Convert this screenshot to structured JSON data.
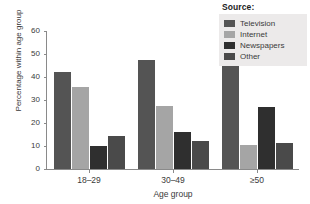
{
  "chart_data": {
    "type": "bar",
    "title": "",
    "xlabel": "Age group",
    "ylabel": "Percentage within age group",
    "categories": [
      "18–29",
      "30–49",
      "≥50"
    ],
    "series": [
      {
        "name": "Television",
        "values": [
          42,
          47.5,
          55.5
        ],
        "color": "#545454"
      },
      {
        "name": "Internet",
        "values": [
          35.5,
          27.5,
          10.5
        ],
        "color": "#a5a5a5"
      },
      {
        "name": "Newspapers",
        "values": [
          10,
          16,
          27
        ],
        "color": "#2f2f2f"
      },
      {
        "name": "Other",
        "values": [
          14.5,
          12,
          11.5
        ],
        "color": "#4a4a4a"
      }
    ],
    "ylim": [
      0,
      60
    ],
    "yticks": [
      0,
      10,
      20,
      30,
      40,
      50,
      60
    ],
    "grid": false,
    "legend_position": "top-right"
  },
  "legend": {
    "title": "Source:",
    "background": "#eceaea"
  },
  "axis": {
    "y_tick_labels": [
      "0",
      "10",
      "20",
      "30",
      "40",
      "50",
      "60"
    ],
    "x_tick_labels": [
      "18–29",
      "30–49",
      "≥50"
    ],
    "y_axis_title": "Percentage within age group",
    "x_axis_title": "Age group"
  }
}
